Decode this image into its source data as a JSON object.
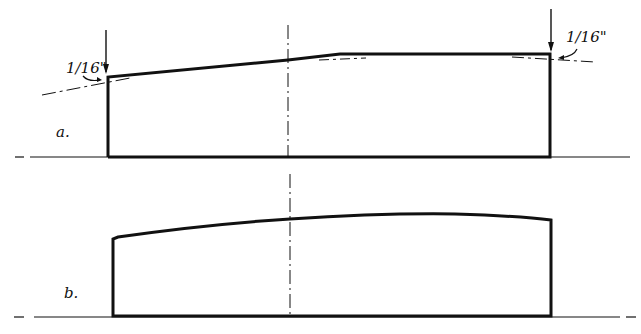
{
  "diagram_a": {
    "label": "a.",
    "left_dimension": "1/16\"",
    "right_dimension": "1/16\""
  },
  "diagram_b": {
    "label": "b."
  },
  "colors": {
    "ink": "#111111",
    "background": "#ffffff"
  }
}
